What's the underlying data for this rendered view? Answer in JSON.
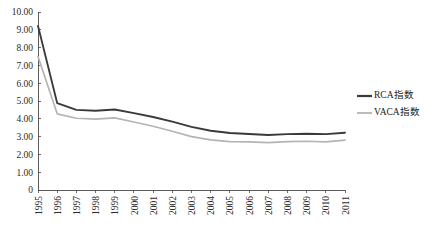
{
  "chart_data": {
    "type": "line",
    "title": "",
    "subtitle": "",
    "xlabel": "",
    "ylabel": "",
    "grid": false,
    "legend_position": "right",
    "categories": [
      "1995",
      "1996",
      "1997",
      "1998",
      "1999",
      "2000",
      "2001",
      "2002",
      "2003",
      "2004",
      "2005",
      "2006",
      "2007",
      "2008",
      "2009",
      "2010",
      "2011"
    ],
    "x": [
      1995,
      1996,
      1997,
      1998,
      1999,
      2000,
      2001,
      2002,
      2003,
      2004,
      2005,
      2006,
      2007,
      2008,
      2009,
      2010,
      2011
    ],
    "ylim": [
      0,
      10
    ],
    "ytick_labels": [
      "10.00",
      "9.00",
      "8.00",
      "7.00",
      "6.00",
      "5.00",
      "4.00",
      "3.00",
      "2.00",
      "1.00",
      "0"
    ],
    "ytick_values": [
      10,
      9,
      8,
      7,
      6,
      5,
      4,
      3,
      2,
      1,
      0
    ],
    "series": [
      {
        "name": "RCA指数",
        "color": "#3a3a3a",
        "width": 1.9,
        "values": [
          9.22,
          4.88,
          4.5,
          4.45,
          4.52,
          4.32,
          4.1,
          3.84,
          3.55,
          3.33,
          3.2,
          3.15,
          3.09,
          3.14,
          3.16,
          3.14,
          3.22
        ]
      },
      {
        "name": "VACA指数",
        "color": "#b4b4b4",
        "width": 1.7,
        "values": [
          7.5,
          4.28,
          4.03,
          3.98,
          4.05,
          3.82,
          3.58,
          3.3,
          3.0,
          2.82,
          2.72,
          2.7,
          2.66,
          2.72,
          2.74,
          2.7,
          2.8
        ]
      }
    ]
  },
  "axes": {
    "plot_left": 38,
    "plot_right": 345,
    "plot_top": 12,
    "plot_bottom": 190
  },
  "legend": {
    "items": [
      {
        "label": "RCA指数",
        "color": "#3a3a3a",
        "width": 2.2
      },
      {
        "label": "VACA指数",
        "color": "#b4b4b4",
        "width": 1.8
      }
    ]
  }
}
